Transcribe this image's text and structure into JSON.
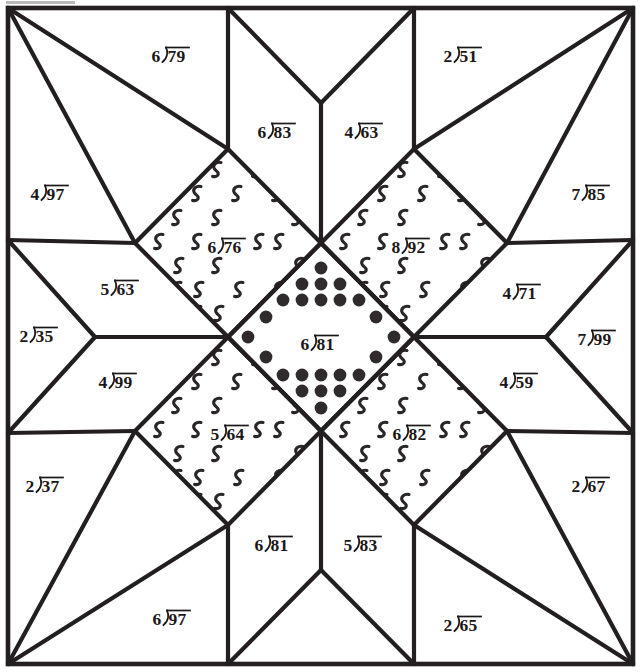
{
  "worksheet": {
    "title": "Division Practice Quilt Block",
    "block_style": "eight-pointed star",
    "width": 642,
    "height": 672,
    "line_color": "#231f20",
    "background_color": "#ffffff",
    "fill_colors": {
      "plain": "#ffffff",
      "squiggle_print": "#ffffff",
      "dot_print": "#ffffff",
      "ink": "#2f2b2d"
    }
  },
  "patches": [
    {
      "id": "p01",
      "region": "top-left-corner-upper",
      "fill": "plain",
      "divisor": "6",
      "dividend": "79",
      "x": 172,
      "y": 62
    },
    {
      "id": "p02",
      "region": "top-center-left",
      "fill": "plain",
      "divisor": "6",
      "dividend": "83",
      "x": 278,
      "y": 138
    },
    {
      "id": "p03",
      "region": "top-center-right",
      "fill": "plain",
      "divisor": "4",
      "dividend": "63",
      "x": 365,
      "y": 138
    },
    {
      "id": "p04",
      "region": "top-right-corner-upper",
      "fill": "plain",
      "divisor": "2",
      "dividend": "51",
      "x": 464,
      "y": 62
    },
    {
      "id": "p05",
      "region": "left-upper-corner-lower",
      "fill": "plain",
      "divisor": "4",
      "dividend": "97",
      "x": 51,
      "y": 200
    },
    {
      "id": "p06",
      "region": "right-upper-corner-lower",
      "fill": "plain",
      "divisor": "7",
      "dividend": "85",
      "x": 592,
      "y": 200
    },
    {
      "id": "p07",
      "region": "star-point-upper-left",
      "fill": "squiggle",
      "divisor": "6",
      "dividend": "76",
      "x": 228,
      "y": 253
    },
    {
      "id": "p08",
      "region": "star-point-upper-right",
      "fill": "squiggle",
      "divisor": "8",
      "dividend": "92",
      "x": 412,
      "y": 253
    },
    {
      "id": "p09",
      "region": "left-upper-kite",
      "fill": "plain",
      "divisor": "5",
      "dividend": "63",
      "x": 121,
      "y": 295
    },
    {
      "id": "p10",
      "region": "right-upper-kite",
      "fill": "plain",
      "divisor": "4",
      "dividend": "71",
      "x": 523,
      "y": 299
    },
    {
      "id": "p11",
      "region": "left-point",
      "fill": "plain",
      "divisor": "2",
      "dividend": "35",
      "x": 40,
      "y": 342
    },
    {
      "id": "p12",
      "region": "center-square",
      "fill": "dot",
      "divisor": "6",
      "dividend": "81",
      "x": 321,
      "y": 350
    },
    {
      "id": "p13",
      "region": "right-point",
      "fill": "plain",
      "divisor": "7",
      "dividend": "99",
      "x": 598,
      "y": 345
    },
    {
      "id": "p14",
      "region": "left-lower-kite",
      "fill": "plain",
      "divisor": "4",
      "dividend": "99",
      "x": 119,
      "y": 388
    },
    {
      "id": "p15",
      "region": "right-lower-kite",
      "fill": "plain",
      "divisor": "4",
      "dividend": "59",
      "x": 520,
      "y": 388
    },
    {
      "id": "p16",
      "region": "star-point-lower-left",
      "fill": "squiggle",
      "divisor": "5",
      "dividend": "64",
      "x": 231,
      "y": 440
    },
    {
      "id": "p17",
      "region": "star-point-lower-right",
      "fill": "squiggle",
      "divisor": "6",
      "dividend": "82",
      "x": 413,
      "y": 440
    },
    {
      "id": "p18",
      "region": "bottom-left-corner-upper",
      "fill": "plain",
      "divisor": "2",
      "dividend": "37",
      "x": 46,
      "y": 492
    },
    {
      "id": "p19",
      "region": "bottom-right-corner-upper",
      "fill": "plain",
      "divisor": "2",
      "dividend": "67",
      "x": 592,
      "y": 492
    },
    {
      "id": "p20",
      "region": "bottom-center-left",
      "fill": "plain",
      "divisor": "6",
      "dividend": "81",
      "x": 275,
      "y": 551
    },
    {
      "id": "p21",
      "region": "bottom-center-right",
      "fill": "plain",
      "divisor": "5",
      "dividend": "83",
      "x": 364,
      "y": 551
    },
    {
      "id": "p22",
      "region": "bottom-left-corner-lower",
      "fill": "plain",
      "divisor": "6",
      "dividend": "97",
      "x": 173,
      "y": 625
    },
    {
      "id": "p23",
      "region": "bottom-right-corner-lower",
      "fill": "plain",
      "divisor": "2",
      "dividend": "65",
      "x": 464,
      "y": 631
    }
  ],
  "center_dots": {
    "description": "solid round dots arranged in a diamond ring inside the center square",
    "rows": [
      {
        "y": 268,
        "xs": [
          321
        ]
      },
      {
        "y": 284,
        "xs": [
          302,
          321,
          340
        ]
      },
      {
        "y": 300,
        "xs": [
          283,
          302,
          321,
          340,
          359
        ]
      },
      {
        "y": 317,
        "xs": [
          266,
          376
        ]
      },
      {
        "y": 337,
        "xs": [
          248,
          394
        ]
      },
      {
        "y": 357,
        "xs": [
          266,
          376
        ]
      },
      {
        "y": 375,
        "xs": [
          283,
          302,
          321,
          340,
          359
        ]
      },
      {
        "y": 391,
        "xs": [
          302,
          321,
          340
        ]
      },
      {
        "y": 408,
        "xs": [
          321
        ]
      }
    ],
    "radius": 6.4
  }
}
